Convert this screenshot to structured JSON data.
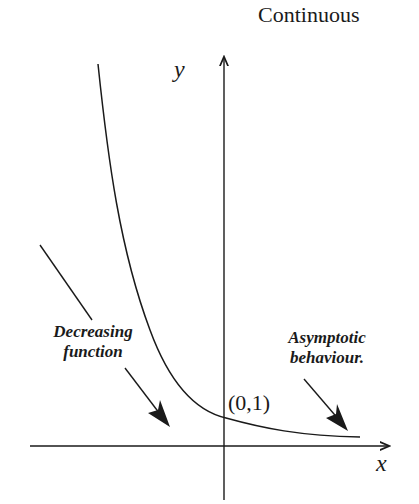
{
  "title": "Continuous",
  "axes": {
    "x_label": "x",
    "y_label": "y"
  },
  "point_label": "(0,1)",
  "annotations": {
    "decreasing": {
      "line1": "Decreasing",
      "line2": "function"
    },
    "asymptotic": {
      "line1": "Asymptotic",
      "line2": "behaviour."
    }
  },
  "colors": {
    "ink": "#1a1a1a",
    "background": "#ffffff"
  }
}
